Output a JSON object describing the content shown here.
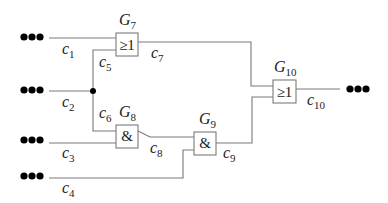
{
  "diagram": {
    "type": "logic-circuit",
    "colors": {
      "wire": "#7a7a7a",
      "text": "#222222",
      "ellipsis": "#000000"
    },
    "gates": [
      {
        "id": "G7",
        "name": "G",
        "sub": "7",
        "symbol": "≥1",
        "type": "OR"
      },
      {
        "id": "G8",
        "name": "G",
        "sub": "8",
        "symbol": "&",
        "type": "AND"
      },
      {
        "id": "G9",
        "name": "G",
        "sub": "9",
        "symbol": "&",
        "type": "AND"
      },
      {
        "id": "G10",
        "name": "G",
        "sub": "10",
        "symbol": "≥1",
        "type": "OR"
      }
    ],
    "signals": [
      {
        "id": "c1",
        "name": "c",
        "sub": "1"
      },
      {
        "id": "c2",
        "name": "c",
        "sub": "2"
      },
      {
        "id": "c3",
        "name": "c",
        "sub": "3"
      },
      {
        "id": "c4",
        "name": "c",
        "sub": "4"
      },
      {
        "id": "c5",
        "name": "c",
        "sub": "5"
      },
      {
        "id": "c6",
        "name": "c",
        "sub": "6"
      },
      {
        "id": "c7",
        "name": "c",
        "sub": "7"
      },
      {
        "id": "c8",
        "name": "c",
        "sub": "8"
      },
      {
        "id": "c9",
        "name": "c",
        "sub": "9"
      },
      {
        "id": "c10",
        "name": "c",
        "sub": "10"
      }
    ],
    "connections": [
      "c1 -> G7",
      "c2 -> fanout(c5, c6)",
      "c5 -> G7",
      "c6 -> G8",
      "c3 -> G8",
      "G7 -> c7 -> G10",
      "G8 -> c8 -> G9",
      "c4 -> G9",
      "G9 -> c9 -> G10",
      "G10 -> c10"
    ]
  }
}
